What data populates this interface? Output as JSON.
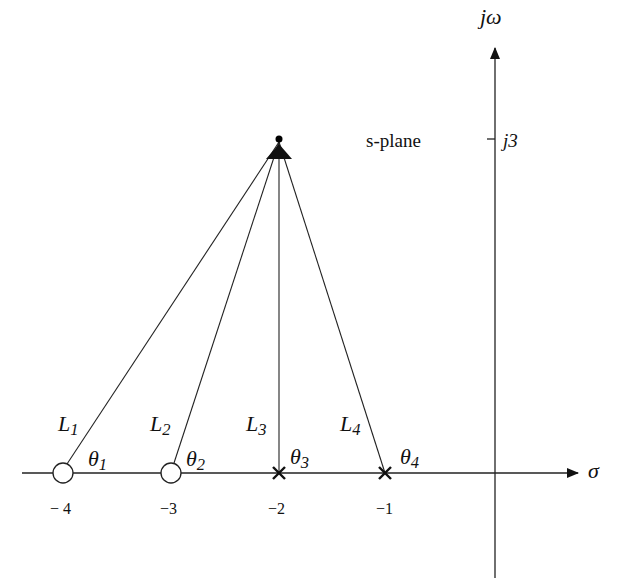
{
  "diagram": {
    "title": "s-plane",
    "axes": {
      "real_label": "σ",
      "imag_label": "jω",
      "imag_tick_label": "j3"
    },
    "test_point": {
      "sigma": -2,
      "omega": 3
    },
    "zeros": [
      {
        "value": -4,
        "tick_label": "− 4",
        "line_label": "L",
        "line_sub": "1",
        "angle_label": "θ",
        "angle_sub": "1"
      },
      {
        "value": -3,
        "tick_label": "−3",
        "line_label": "L",
        "line_sub": "2",
        "angle_label": "θ",
        "angle_sub": "2"
      }
    ],
    "poles": [
      {
        "value": -2,
        "tick_label": "−2",
        "line_label": "L",
        "line_sub": "3",
        "angle_label": "θ",
        "angle_sub": "3"
      },
      {
        "value": -1,
        "tick_label": "−1",
        "line_label": "L",
        "line_sub": "4",
        "angle_label": "θ",
        "angle_sub": "4"
      }
    ]
  }
}
